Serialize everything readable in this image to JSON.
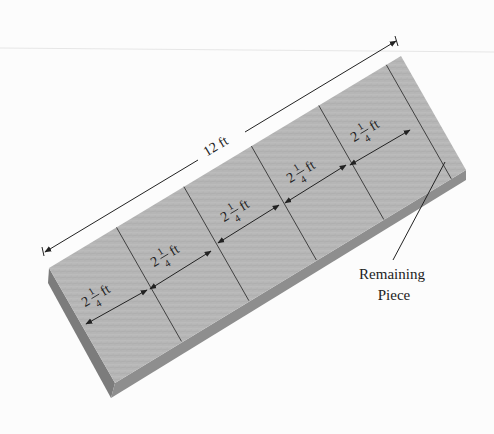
{
  "diagram": {
    "total_length": {
      "value": "12",
      "unit": "ft",
      "label": "12 ft"
    },
    "pieces": [
      {
        "whole": "2",
        "num": "1",
        "den": "4",
        "unit": "ft"
      },
      {
        "whole": "2",
        "num": "1",
        "den": "4",
        "unit": "ft"
      },
      {
        "whole": "2",
        "num": "1",
        "den": "4",
        "unit": "ft"
      },
      {
        "whole": "2",
        "num": "1",
        "den": "4",
        "unit": "ft"
      },
      {
        "whole": "2",
        "num": "1",
        "den": "4",
        "unit": "ft"
      }
    ],
    "remaining_label_line1": "Remaining",
    "remaining_label_line2": "Piece",
    "colors": {
      "wood_top": "#b4b4b4",
      "wood_side": "#8a8a8a",
      "wood_end": "#7c7c7c",
      "line": "#222222"
    }
  }
}
